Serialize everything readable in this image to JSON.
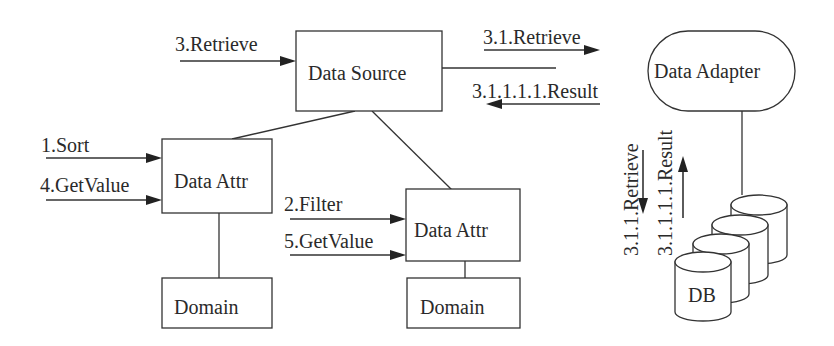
{
  "diagram": {
    "nodes": {
      "data_source": "Data Source",
      "data_adapter": "Data Adapter",
      "data_attr_1": "Data Attr",
      "data_attr_2": "Data Attr",
      "domain_1": "Domain",
      "domain_2": "Domain",
      "db": "DB"
    },
    "messages": {
      "retrieve_3": "3.Retrieve",
      "retrieve_3_1": "3.1.Retrieve",
      "result_3_1_1_1_1_h": "3.1.1.1.1.Result",
      "retrieve_3_1_1": "3.1.1.Retrieve",
      "result_3_1_1_1_1_v": "3.1.1.1.1.Result",
      "sort_1": "1.Sort",
      "getvalue_4": "4.GetValue",
      "filter_2": "2.Filter",
      "getvalue_5": "5.GetValue"
    },
    "colors": {
      "stroke": "#333333",
      "text": "#2a2a2a",
      "background": "#ffffff"
    }
  }
}
